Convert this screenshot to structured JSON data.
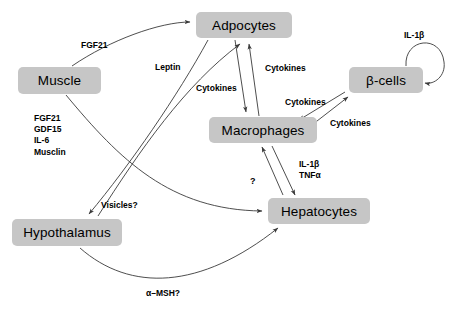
{
  "diagram": {
    "background_color": "#ffffff",
    "node_fill_color": "#c6c6c6",
    "stroke_color": "#3a3a3a",
    "nodes": [
      {
        "id": "adipocytes",
        "label": "Adpocytes",
        "x": 196,
        "y": 12,
        "w": 96,
        "h": 26
      },
      {
        "id": "muscle",
        "label": "Muscle",
        "x": 18,
        "y": 67,
        "w": 83,
        "h": 27
      },
      {
        "id": "beta_cells",
        "label": "β-cells",
        "x": 349,
        "y": 67,
        "w": 74,
        "h": 26
      },
      {
        "id": "macrophages",
        "label": "Macrophages",
        "x": 209,
        "y": 117,
        "w": 108,
        "h": 26
      },
      {
        "id": "hypothalamus",
        "label": "Hypothalamus",
        "x": 12,
        "y": 219,
        "w": 110,
        "h": 27
      },
      {
        "id": "hepatocytes",
        "label": "Hepatocytes",
        "x": 268,
        "y": 198,
        "w": 102,
        "h": 26
      }
    ],
    "labels": [
      {
        "id": "fgf21_top",
        "text": "FGF21",
        "x": 81,
        "y": 40
      },
      {
        "id": "leptin",
        "text": "Leptin",
        "x": 155,
        "y": 62
      },
      {
        "id": "cytokines_adip_left",
        "text": "Cytokines",
        "x": 196,
        "y": 83
      },
      {
        "id": "cytokines_adip_right",
        "text": "Cytokines",
        "x": 265,
        "y": 63
      },
      {
        "id": "cytokines_macro_beta",
        "text": "Cytokines",
        "x": 285,
        "y": 97
      },
      {
        "id": "cytokines_beta_macro",
        "text": "Cytokines",
        "x": 330,
        "y": 118
      },
      {
        "id": "il1b_beta",
        "text": "IL-1β",
        "x": 404,
        "y": 30
      },
      {
        "id": "muscle_factors",
        "text": "FGF21\nGDF15\nIL-6\nMusclin",
        "x": 34,
        "y": 113
      },
      {
        "id": "visicles",
        "text": "Visicles?",
        "x": 101,
        "y": 200
      },
      {
        "id": "question_mark",
        "text": "?",
        "x": 250,
        "y": 176
      },
      {
        "id": "il1b_tnfa",
        "text": "IL-1β\nTNFα",
        "x": 299,
        "y": 159
      },
      {
        "id": "alpha_msh",
        "text": "α–MSH?",
        "x": 146,
        "y": 288
      }
    ],
    "edges": [
      {
        "id": "muscle-to-adipocytes",
        "from": "muscle",
        "to": "adipocytes",
        "signal": "FGF21"
      },
      {
        "id": "muscle-to-hepatocytes",
        "from": "muscle",
        "to": "hepatocytes",
        "signal": ""
      },
      {
        "id": "adipocytes-to-hypothalamus",
        "from": "adipocytes",
        "to": "hypothalamus",
        "signal": "Leptin"
      },
      {
        "id": "hypothalamus-to-adipocytes",
        "from": "hypothalamus",
        "to": "adipocytes",
        "signal": "Visicles?"
      },
      {
        "id": "adipocytes-to-macrophages",
        "from": "adipocytes",
        "to": "macrophages",
        "signal": "Cytokines"
      },
      {
        "id": "macrophages-to-adipocytes",
        "from": "macrophages",
        "to": "adipocytes",
        "signal": "Cytokines"
      },
      {
        "id": "macrophages-to-betacells",
        "from": "macrophages",
        "to": "beta_cells",
        "signal": "Cytokines"
      },
      {
        "id": "betacells-to-macrophages",
        "from": "beta_cells",
        "to": "macrophages",
        "signal": "Cytokines"
      },
      {
        "id": "betacells-self-loop",
        "from": "beta_cells",
        "to": "beta_cells",
        "signal": "IL-1β"
      },
      {
        "id": "macrophages-to-hepatocytes",
        "from": "macrophages",
        "to": "hepatocytes",
        "signal": "IL-1β / TNFα"
      },
      {
        "id": "hepatocytes-to-macrophages",
        "from": "hepatocytes",
        "to": "macrophages",
        "signal": "?"
      },
      {
        "id": "hypothalamus-to-hepatocytes",
        "from": "hypothalamus",
        "to": "hepatocytes",
        "signal": "α–MSH?"
      }
    ]
  }
}
